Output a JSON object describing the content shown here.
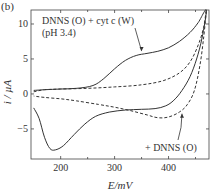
{
  "panel_label": "(b)",
  "chart_data": {
    "type": "line",
    "title": "",
    "xlabel": "E/mV",
    "ylabel": "i / µA",
    "xlim": [
      145,
      475
    ],
    "ylim": [
      -9.3,
      12
    ],
    "xticks": [
      200,
      300,
      400
    ],
    "xtick_labels": [
      "200",
      "300",
      "400"
    ],
    "xminor_ticks": [
      250,
      350,
      450
    ],
    "yticks": [
      10,
      5,
      0,
      -5
    ],
    "ytick_labels": [
      "10",
      "5",
      "0",
      "−5"
    ],
    "grid": false,
    "legend": "none (inline annotations)",
    "series": [
      {
        "name": "DNNS (O) + cyt c (W) (pH 3.4)",
        "style": "solid",
        "points": [
          [
            150,
            0.5
          ],
          [
            170,
            0.6
          ],
          [
            200,
            0.7
          ],
          [
            230,
            0.8
          ],
          [
            260,
            1.2
          ],
          [
            280,
            2.2
          ],
          [
            300,
            3.6
          ],
          [
            320,
            4.8
          ],
          [
            340,
            5.5
          ],
          [
            360,
            5.8
          ],
          [
            380,
            6.1
          ],
          [
            400,
            6.6
          ],
          [
            420,
            7.5
          ],
          [
            440,
            8.8
          ],
          [
            455,
            10.2
          ],
          [
            470,
            12
          ],
          [
            462,
            8
          ],
          [
            452,
            5
          ],
          [
            440,
            2.5
          ],
          [
            425,
            0.5
          ],
          [
            410,
            -0.9
          ],
          [
            395,
            -1.7
          ],
          [
            375,
            -2.1
          ],
          [
            350,
            -2.2
          ],
          [
            320,
            -2.3
          ],
          [
            290,
            -2.6
          ],
          [
            265,
            -3.2
          ],
          [
            245,
            -4.3
          ],
          [
            225,
            -5.8
          ],
          [
            205,
            -7.4
          ],
          [
            190,
            -8.0
          ],
          [
            180,
            -7.8
          ],
          [
            170,
            -6.2
          ],
          [
            160,
            -3.5
          ],
          [
            150,
            -2.0
          ]
        ]
      },
      {
        "name": "+ DNNS (O)",
        "style": "dashed",
        "points": [
          [
            150,
            0.3
          ],
          [
            170,
            0.6
          ],
          [
            200,
            0.7
          ],
          [
            250,
            0.8
          ],
          [
            300,
            1.0
          ],
          [
            350,
            1.3
          ],
          [
            390,
            1.9
          ],
          [
            420,
            3.0
          ],
          [
            440,
            4.6
          ],
          [
            455,
            7.0
          ],
          [
            465,
            9.5
          ],
          [
            470,
            12
          ],
          [
            465,
            8
          ],
          [
            458,
            4
          ],
          [
            448,
            0.5
          ],
          [
            435,
            -1.5
          ],
          [
            420,
            -2.6
          ],
          [
            400,
            -3.3
          ],
          [
            380,
            -3.4
          ],
          [
            360,
            -3.0
          ],
          [
            330,
            -2.4
          ],
          [
            300,
            -1.9
          ],
          [
            270,
            -1.5
          ],
          [
            230,
            -1.0
          ],
          [
            200,
            -0.7
          ],
          [
            170,
            -0.5
          ],
          [
            150,
            -0.3
          ]
        ]
      }
    ],
    "annotations": [
      {
        "text": "DNNS (O) + cyt c (W)",
        "line2": "(pH 3.4)",
        "arrow_to": [
          350,
          5.7
        ]
      },
      {
        "text": "+ DNNS (O)",
        "arrow_to": [
          425,
          -2.4
        ]
      }
    ]
  }
}
